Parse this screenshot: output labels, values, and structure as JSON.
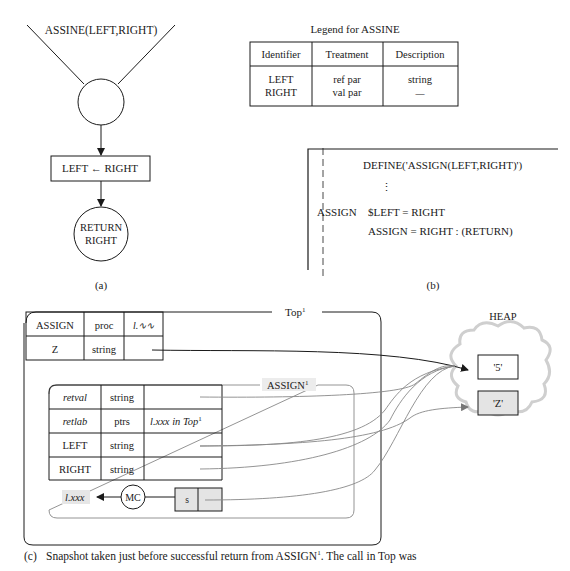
{
  "panel_a": {
    "header_label": "ASSINE(LEFT,RIGHT)",
    "assign_box": "LEFT ← RIGHT",
    "return_line1": "RETURN",
    "return_line2": "RIGHT",
    "caption": "(a)"
  },
  "legend": {
    "title": "Legend for ASSINE",
    "columns": [
      "Identifier",
      "Treatment",
      "Description"
    ],
    "rows": [
      {
        "identifier": "LEFT",
        "treatment": "ref par",
        "description": "string"
      },
      {
        "identifier": "RIGHT",
        "treatment": "val par",
        "description": "—"
      }
    ]
  },
  "panel_b": {
    "line1": "DEFINE('ASSIGN(LEFT,RIGHT)')",
    "ellipsis": "⋮",
    "label": "ASSIGN",
    "line2": "$LEFT = RIGHT",
    "line3": "ASSIGN = RIGHT : (RETURN)",
    "caption": "(b)"
  },
  "panel_c": {
    "top_frame_label": "Top",
    "top_frame_sup": "1",
    "top_table": [
      {
        "name": "ASSIGN",
        "type": "proc",
        "value": "l.∿∿"
      },
      {
        "name": "Z",
        "type": "string",
        "value": ""
      }
    ],
    "assign_frame_label": "ASSIGN",
    "assign_frame_sup": "1",
    "assign_table": [
      {
        "name": "retval",
        "type": "string",
        "value": "",
        "italic": true
      },
      {
        "name": "retlab",
        "type": "ptrs",
        "value": "l.xxx in Top",
        "value_sup": "1",
        "italic": true
      },
      {
        "name": "LEFT",
        "type": "string",
        "value": "",
        "italic": false
      },
      {
        "name": "RIGHT",
        "type": "string",
        "value": "",
        "italic": false
      }
    ],
    "return_label": "l.xxx",
    "mc_label": "MC",
    "stack_cell": "s",
    "heap": {
      "title": "HEAP",
      "cells": [
        {
          "value": "'5'",
          "shaded": false
        },
        {
          "value": "'Z'",
          "shaded": true
        }
      ]
    }
  },
  "caption": {
    "tag": "(c)",
    "text": "Snapshot taken just before successful return from ASSIGN",
    "sup": "1",
    "text2": ". The call in Top was"
  }
}
